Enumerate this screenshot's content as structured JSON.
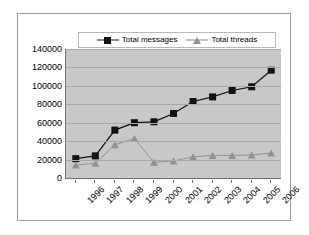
{
  "chart_data": {
    "type": "line",
    "title": "",
    "xlabel": "",
    "ylabel": "",
    "categories": [
      "1996",
      "1997",
      "1998",
      "1999",
      "2000",
      "2001",
      "2002",
      "2003",
      "2004",
      "2005",
      "2006"
    ],
    "series": [
      {
        "name": "Total messages",
        "values": [
          21000,
          24000,
          52000,
          60000,
          61000,
          70000,
          83000,
          88000,
          95000,
          99000,
          117000
        ],
        "color": "#111111",
        "marker": "square"
      },
      {
        "name": "Total threads",
        "values": [
          14000,
          16000,
          36000,
          43000,
          17000,
          18500,
          23000,
          24500,
          24500,
          25000,
          27000
        ],
        "color": "#919191",
        "marker": "triangle"
      }
    ],
    "ylim": [
      0,
      140000
    ],
    "yticks": [
      0,
      20000,
      40000,
      60000,
      80000,
      100000,
      120000,
      140000
    ],
    "ytick_labels": [
      "0",
      "20000",
      "40000",
      "60000",
      "80000",
      "100000",
      "120000",
      "140000"
    ],
    "grid": true,
    "legend_position": "top-center",
    "plot_background": "#c8c8c8",
    "chart_background": "#ffffff"
  },
  "legend": {
    "entries": [
      {
        "label": "Total messages"
      },
      {
        "label": "Total threads"
      }
    ]
  }
}
